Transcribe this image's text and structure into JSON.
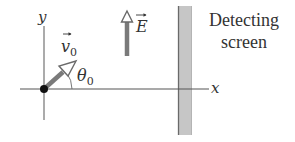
{
  "diagram": {
    "axes": {
      "x_label": "x",
      "y_label": "y"
    },
    "velocity": {
      "symbol": "v",
      "subscript": "0",
      "angle_symbol": "θ",
      "angle_subscript": "0"
    },
    "field": {
      "symbol": "E",
      "direction": "up"
    },
    "screen": {
      "label_line1": "Detecting",
      "label_line2": "screen"
    },
    "colors": {
      "axis": "#555555",
      "arrow_fill": "#7a7a7a",
      "screen_fill": "#c4c4c4",
      "screen_edge": "#6a6a6a",
      "dot": "#111111"
    }
  }
}
